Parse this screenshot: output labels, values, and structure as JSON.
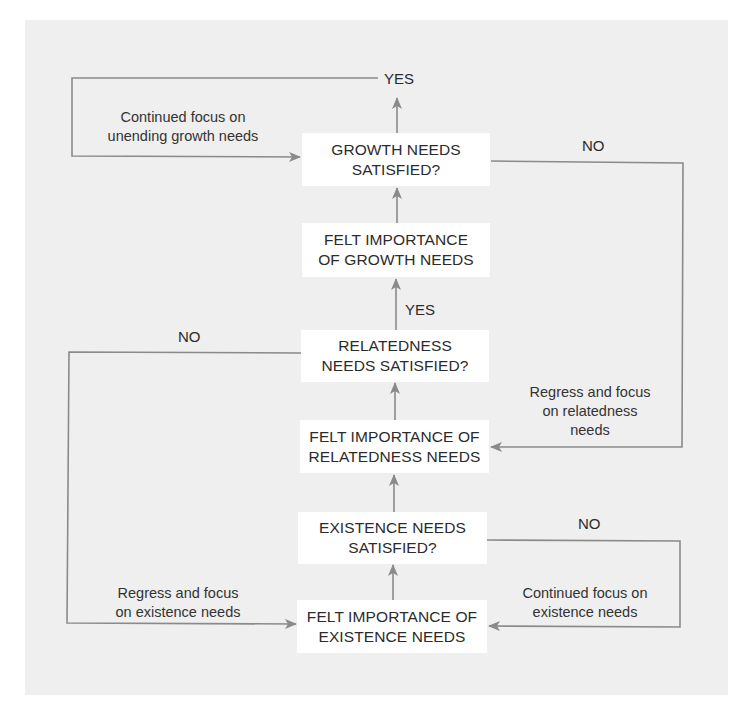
{
  "diagram": {
    "type": "flowchart",
    "background_color": "#efefef",
    "line_color": "#8a8a8a",
    "nodes": [
      {
        "id": "growth_satisfied",
        "line1": "GROWTH NEEDS",
        "line2": "SATISFIED?"
      },
      {
        "id": "growth_importance",
        "line1": "FELT IMPORTANCE",
        "line2": "OF GROWTH NEEDS"
      },
      {
        "id": "relatedness_satisfied",
        "line1": "RELATEDNESS",
        "line2": "NEEDS SATISFIED?"
      },
      {
        "id": "relatedness_importance",
        "line1": "FELT IMPORTANCE OF",
        "line2": "RELATEDNESS NEEDS"
      },
      {
        "id": "existence_satisfied",
        "line1": "EXISTENCE NEEDS",
        "line2": "SATISFIED?"
      },
      {
        "id": "existence_importance",
        "line1": "FELT IMPORTANCE OF",
        "line2": "EXISTENCE NEEDS"
      }
    ],
    "edge_labels": {
      "growth_yes": "YES",
      "growth_no": "NO",
      "relatedness_yes": "YES",
      "relatedness_no": "NO",
      "existence_no": "NO",
      "continued_growth_1": "Continued focus on",
      "continued_growth_2": "unending growth needs",
      "regress_relatedness_1": "Regress and focus",
      "regress_relatedness_2": "on relatedness",
      "regress_relatedness_3": "needs",
      "regress_existence_1": "Regress and focus",
      "regress_existence_2": "on existence needs",
      "continued_existence_1": "Continued focus on",
      "continued_existence_2": "existence needs"
    }
  }
}
